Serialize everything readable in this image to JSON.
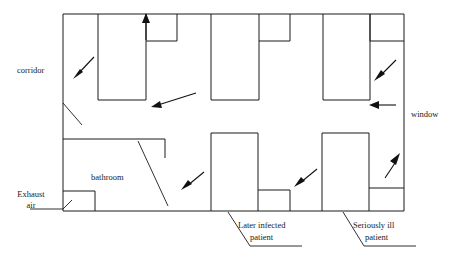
{
  "diagram": {
    "stroke_color": "#1a1a1a",
    "background_color": "#ffffff",
    "labels": {
      "corridor": "corridor",
      "window": "window",
      "bathroom": "bathroom",
      "exhaust_air_line1": "Exhaust",
      "exhaust_air_line2": "air",
      "later_infected_line1": "Later infected",
      "later_infected_line2": "patient",
      "seriously_ill_line1": "Seriously ill",
      "seriously_ill_line2": "patient"
    },
    "airflow_arrows": [
      {
        "name": "upper-left-inflow",
        "direction": "down-left"
      },
      {
        "name": "upper-room-exhaust-up",
        "direction": "up"
      },
      {
        "name": "corridor-flow-left-upper",
        "direction": "left"
      },
      {
        "name": "window-inflow-right-upper",
        "direction": "down-left"
      },
      {
        "name": "window-inflow-right-middle",
        "direction": "left"
      },
      {
        "name": "bathroom-inflow",
        "direction": "down-left"
      },
      {
        "name": "later-infected-inflow",
        "direction": "down-left"
      },
      {
        "name": "seriously-ill-outflow",
        "direction": "up-right"
      }
    ],
    "rooms": {
      "upper": [
        {
          "name": "upper-room-1"
        },
        {
          "name": "upper-alcove-1"
        },
        {
          "name": "upper-room-2"
        },
        {
          "name": "upper-alcove-2"
        },
        {
          "name": "upper-room-3"
        },
        {
          "name": "upper-alcove-3"
        }
      ],
      "lower": [
        {
          "name": "bathroom-room"
        },
        {
          "name": "exhaust-air-box"
        },
        {
          "name": "later-infected-room"
        },
        {
          "name": "later-infected-bathroom"
        },
        {
          "name": "seriously-ill-room"
        },
        {
          "name": "seriously-ill-bathroom"
        }
      ]
    }
  }
}
